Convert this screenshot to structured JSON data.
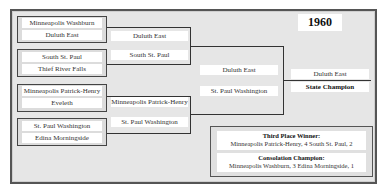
{
  "year": "1960",
  "round1": [
    {
      "teams": [
        "Minneapolis Washburn",
        "Duluth East"
      ]
    },
    {
      "teams": [
        "South St. Paul",
        "Thief River Falls"
      ]
    },
    {
      "teams": [
        "Minneapolis Patrick-Henry",
        "Eveleth"
      ]
    },
    {
      "teams": [
        "St. Paul Washington",
        "Edina Morningside"
      ]
    }
  ],
  "round2": [
    "Duluth East",
    "South St. Paul",
    "Minneapolis Patrick-Henry",
    "St. Paul Washington"
  ],
  "semifinal": [
    "Duluth East",
    "St. Paul Washington"
  ],
  "final": {
    "winner": "Duluth East",
    "label": "State Champion"
  },
  "info": {
    "third_place_title": "Third Place Winner:",
    "third_place_result": "Minneapolis Patrick-Henry, 4  South St. Paul, 2",
    "consolation_title": "Consolation Champion:",
    "consolation_result": "Minneapolis Washburn, 3  Edina Morningside, 1"
  },
  "colors": {
    "frame_bg": "#e6e6e6",
    "frame_border": "#555555",
    "slot_bg": "#ffffff",
    "line": "#333333"
  }
}
